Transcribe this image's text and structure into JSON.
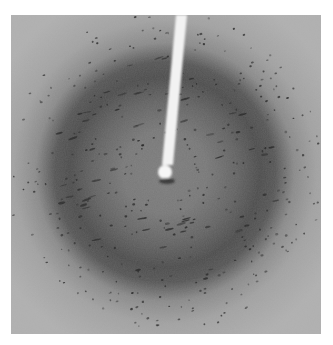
{
  "figure": {
    "kind": "x-ray diffraction pattern",
    "colormap": "grayscale",
    "colors": {
      "background": "#a6a6a6",
      "ring": "#4a4a4a",
      "inner": "#7a7a7a",
      "spot": "#2a2a2a",
      "beamstop": "#f4f4f4",
      "page": "#ffffff"
    }
  }
}
